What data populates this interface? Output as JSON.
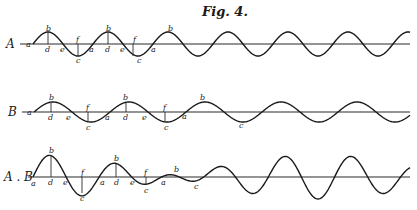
{
  "figure": {
    "title": "Fig. 4.",
    "ink_color": "#1a1a1a",
    "background": "#ffffff"
  },
  "rows": [
    {
      "id": "A",
      "label": "A",
      "label_pos": [
        6,
        48
      ],
      "axis": {
        "y": 44,
        "x0": 20,
        "x1": 410
      },
      "wave": {
        "type": "sine",
        "x0": 33,
        "x1": 410,
        "wavelength": 60,
        "amplitude": 12,
        "phase": 0
      },
      "ordinates": [
        {
          "x": 48,
          "y_top": 32,
          "y_bot": 44
        },
        {
          "x": 78,
          "y_top": 44,
          "y_bot": 56
        },
        {
          "x": 108,
          "y_top": 32,
          "y_bot": 44
        },
        {
          "x": 133,
          "y_top": 44,
          "y_bot": 56
        }
      ],
      "point_labels": [
        {
          "t": "a",
          "x": 26,
          "y": 47
        },
        {
          "t": "b",
          "x": 46,
          "y": 31
        },
        {
          "t": "d",
          "x": 45,
          "y": 52
        },
        {
          "t": "e",
          "x": 60,
          "y": 52
        },
        {
          "t": "f",
          "x": 76,
          "y": 42
        },
        {
          "t": "c",
          "x": 76,
          "y": 63
        },
        {
          "t": "a",
          "x": 89,
          "y": 52
        },
        {
          "t": "b",
          "x": 106,
          "y": 31
        },
        {
          "t": "d",
          "x": 105,
          "y": 52
        },
        {
          "t": "e",
          "x": 120,
          "y": 52
        },
        {
          "t": "f",
          "x": 133,
          "y": 42
        },
        {
          "t": "c",
          "x": 137,
          "y": 63
        },
        {
          "t": "a",
          "x": 151,
          "y": 52
        },
        {
          "t": "b",
          "x": 168,
          "y": 31
        }
      ]
    },
    {
      "id": "B",
      "label": "B",
      "label_pos": [
        8,
        116
      ],
      "axis": {
        "y": 112,
        "x0": 22,
        "x1": 410
      },
      "wave": {
        "type": "sine",
        "x0": 34,
        "x1": 410,
        "wavelength": 76,
        "amplitude": 10,
        "phase": 0
      },
      "ordinates": [
        {
          "x": 51,
          "y_top": 102,
          "y_bot": 112
        },
        {
          "x": 88,
          "y_top": 112,
          "y_bot": 122
        },
        {
          "x": 126,
          "y_top": 102,
          "y_bot": 112
        },
        {
          "x": 165,
          "y_top": 112,
          "y_bot": 122
        }
      ],
      "point_labels": [
        {
          "t": "a",
          "x": 27,
          "y": 115
        },
        {
          "t": "b",
          "x": 49,
          "y": 100
        },
        {
          "t": "d",
          "x": 48,
          "y": 120
        },
        {
          "t": "e",
          "x": 66,
          "y": 120
        },
        {
          "t": "f",
          "x": 86,
          "y": 110
        },
        {
          "t": "c",
          "x": 86,
          "y": 130
        },
        {
          "t": "a",
          "x": 105,
          "y": 120
        },
        {
          "t": "b",
          "x": 123,
          "y": 100
        },
        {
          "t": "d",
          "x": 123,
          "y": 120
        },
        {
          "t": "e",
          "x": 142,
          "y": 120
        },
        {
          "t": "f",
          "x": 163,
          "y": 110
        },
        {
          "t": "c",
          "x": 164,
          "y": 130
        },
        {
          "t": "a",
          "x": 182,
          "y": 119
        },
        {
          "t": "b",
          "x": 200,
          "y": 100
        },
        {
          "t": "c",
          "x": 239,
          "y": 128
        }
      ]
    },
    {
      "id": "AB",
      "label": "A . B",
      "label_pos": [
        4,
        181
      ],
      "axis": {
        "y": 177,
        "x0": 28,
        "x1": 410
      },
      "wave": {
        "type": "beat",
        "x0": 33,
        "x1": 410,
        "components": [
          {
            "wavelength": 60,
            "amplitude": 12
          },
          {
            "wavelength": 76,
            "amplitude": 10
          }
        ]
      },
      "ordinates": [
        {
          "x": 51,
          "y_top": 155,
          "y_bot": 177
        },
        {
          "x": 82,
          "y_top": 177,
          "y_bot": 193
        },
        {
          "x": 116,
          "y_top": 164,
          "y_bot": 177
        },
        {
          "x": 146,
          "y_top": 177,
          "y_bot": 185
        }
      ],
      "point_labels": [
        {
          "t": "a",
          "x": 31,
          "y": 186
        },
        {
          "t": "b",
          "x": 49,
          "y": 153
        },
        {
          "t": "d",
          "x": 48,
          "y": 185
        },
        {
          "t": "e",
          "x": 63,
          "y": 185
        },
        {
          "t": "f",
          "x": 81,
          "y": 175
        },
        {
          "t": "c",
          "x": 80,
          "y": 201
        },
        {
          "t": "a",
          "x": 100,
          "y": 185
        },
        {
          "t": "b",
          "x": 114,
          "y": 161
        },
        {
          "t": "d",
          "x": 114,
          "y": 185
        },
        {
          "t": "e",
          "x": 130,
          "y": 185
        },
        {
          "t": "f",
          "x": 144,
          "y": 175
        },
        {
          "t": "c",
          "x": 144,
          "y": 193
        },
        {
          "t": "a",
          "x": 161,
          "y": 185
        },
        {
          "t": "b",
          "x": 174,
          "y": 172
        },
        {
          "t": "c",
          "x": 194,
          "y": 189
        }
      ]
    }
  ]
}
